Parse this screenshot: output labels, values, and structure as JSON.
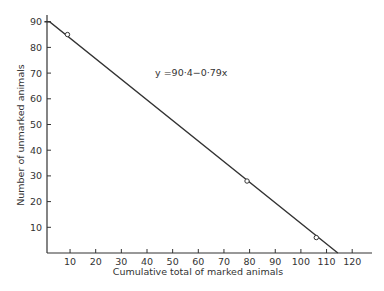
{
  "chart_data": {
    "type": "line",
    "title": "",
    "xlabel": "Cumulative total of marked animals",
    "ylabel": "Number of unmarked animals",
    "xlim": [
      0,
      125
    ],
    "ylim": [
      0,
      92
    ],
    "grid": false,
    "x_ticks": [
      10,
      20,
      30,
      40,
      50,
      60,
      70,
      80,
      90,
      100,
      110,
      120
    ],
    "y_ticks": [
      10,
      20,
      30,
      40,
      50,
      60,
      70,
      80,
      90
    ],
    "annotation": "y =90·4−0·79x",
    "series": [
      {
        "name": "regression line",
        "kind": "line",
        "x": [
          2,
          114.4
        ],
        "y": [
          90,
          0
        ]
      },
      {
        "name": "observations",
        "kind": "scatter",
        "marker": "open-circle",
        "x": [
          9,
          79,
          106
        ],
        "y": [
          85,
          28,
          6
        ]
      }
    ]
  }
}
